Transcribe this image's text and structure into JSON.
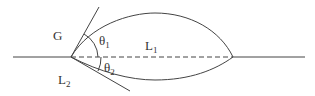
{
  "diagram": {
    "labels": {
      "gas": "G",
      "liquid1": "L",
      "liquid1_sub": "1",
      "liquid2": "L",
      "liquid2_sub": "2",
      "theta1": "θ",
      "theta1_sub": "1",
      "theta2": "θ",
      "theta2_sub": "2"
    },
    "colors": {
      "line": "#444444",
      "background": "#ffffff"
    }
  }
}
